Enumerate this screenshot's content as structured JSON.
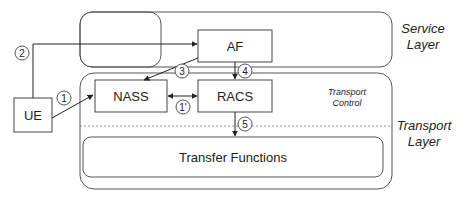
{
  "diagram": {
    "layers": {
      "service": {
        "line1": "Service",
        "line2": "Layer"
      },
      "transport": {
        "line1": "Transport",
        "line2": "Layer"
      },
      "transport_control": {
        "line1": "Transport",
        "line2": "Control"
      }
    },
    "nodes": {
      "ue": "UE",
      "af": "AF",
      "nass": "NASS",
      "racs": "RACS",
      "transfer": "Transfer Functions"
    },
    "steps": [
      "1",
      "2",
      "3",
      "4",
      "1'",
      "5"
    ],
    "colors": {
      "stroke": "#333333",
      "background": "#ffffff",
      "text": "#222222"
    }
  }
}
